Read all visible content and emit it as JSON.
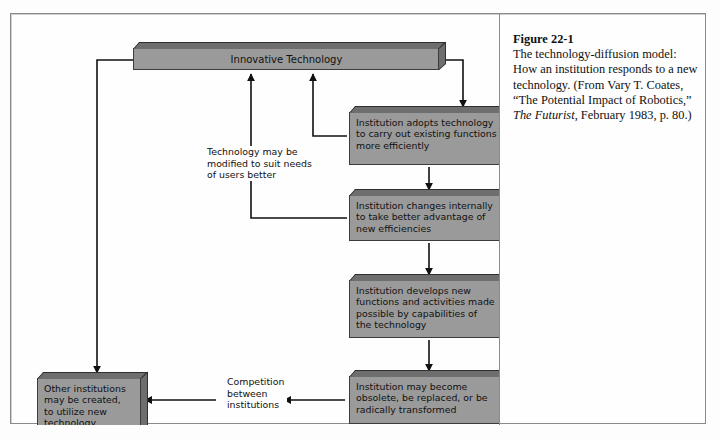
{
  "figure": {
    "number": "Figure 22-1",
    "line1": "The technology-diffusion",
    "line2": "model: How an institution",
    "line3": "responds to a new technology.",
    "line4": "(From Vary T. Coates, “The",
    "line5": "Potential Impact of Robotics,”",
    "source_italic": "The Futurist",
    "line6_rest": ", February 1983,",
    "line7": "p. 80.)"
  },
  "diagram": {
    "type": "flowchart",
    "nodes": [
      {
        "id": "innovative-technology",
        "label": "Innovative Technology"
      },
      {
        "id": "institution-adopts",
        "label": "Institution adopts technology\nto carry out existing functions\nmore efficiently"
      },
      {
        "id": "institution-changes",
        "label": "Institution changes internally\nto take better advantage of\nnew efficiencies"
      },
      {
        "id": "institution-develops",
        "label": "Institution develops new\nfunctions and activities made\npossible by capabilities of\nthe technology"
      },
      {
        "id": "institution-obsolete",
        "label": "Institution may become\nobsolete, be replaced, or be\nradically transformed"
      },
      {
        "id": "other-institutions",
        "label": "Other institutions\nmay be created,\nto utilize new\ntechnology"
      }
    ],
    "edge_labels": [
      {
        "id": "technology-modified",
        "label": "Technology may be\nmodified to suit needs\nof users better"
      },
      {
        "id": "competition",
        "label": "Competition\nbetween\ninstitutions"
      }
    ],
    "colors": {
      "box_face": "#9a9a9a",
      "box_shade": "#6e6e6e",
      "box_outline": "#3c3c3c",
      "frame": "#8a8a8a",
      "background": "#fefefe",
      "arrow": "#111111"
    }
  }
}
